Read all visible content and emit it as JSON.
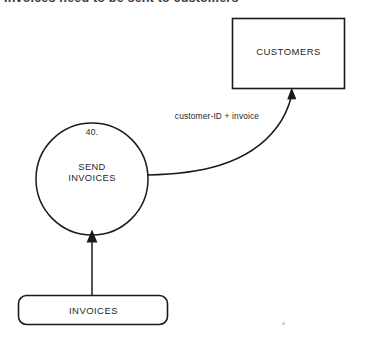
{
  "page": {
    "width": 366,
    "height": 342,
    "background": "#ffffff",
    "ink_color": "#1a1a1a",
    "heading": "Invoices need to be sent to customers"
  },
  "diagram": {
    "type": "data-flow-diagram",
    "external_entity": {
      "label": "CUSTOMERS"
    },
    "process": {
      "number": "40.",
      "name_line1": "SEND",
      "name_line2": "INVOICES"
    },
    "data_store": {
      "label": "INVOICES"
    },
    "flows": [
      {
        "label": "customer-ID + invoice",
        "from": "SEND INVOICES",
        "to": "CUSTOMERS",
        "style": "curved"
      },
      {
        "label": "",
        "from": "INVOICES",
        "to": "SEND INVOICES",
        "style": "straight"
      }
    ]
  }
}
